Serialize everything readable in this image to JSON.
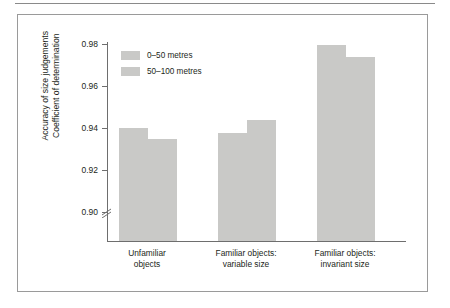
{
  "chart_data": {
    "type": "bar",
    "title": "",
    "xlabel": "",
    "ylabel": "Accuracy of size judgements\nCoefficient of determination",
    "ylabel_line1": "Accuracy of size judgements",
    "ylabel_line2": "Coefficient of determination",
    "ylim": [
      0.89,
      0.988
    ],
    "axis_break": true,
    "grid": false,
    "legend_position": "upper-left inside",
    "ytick_labels": [
      "0.98",
      "0.96",
      "0.94",
      "0.92",
      "0.90"
    ],
    "ytick_values": [
      0.98,
      0.96,
      0.94,
      0.92,
      0.9
    ],
    "categories": [
      "Unfamiliar objects",
      "Familiar objects: variable size",
      "Familiar objects: invariant size"
    ],
    "category_label_lines": [
      [
        "Unfamiliar",
        "objects"
      ],
      [
        "Familiar objects:",
        "variable size"
      ],
      [
        "Familiar objects:",
        "invariant size"
      ]
    ],
    "series": [
      {
        "name": "0–50 metres",
        "values": [
          0.94,
          0.9375,
          0.9795
        ],
        "color": "#c9c9c7"
      },
      {
        "name": "50–100 metres",
        "values": [
          0.935,
          0.944,
          0.974
        ],
        "color": "#c9c9c7"
      }
    ]
  },
  "colors": {
    "bar_fill": "#c9c9c7",
    "axis": "#6e6e6e",
    "frame_border": "#9a9a9a",
    "top_rule": "#8a8a8a",
    "text": "#231f20",
    "background": "#ffffff"
  }
}
